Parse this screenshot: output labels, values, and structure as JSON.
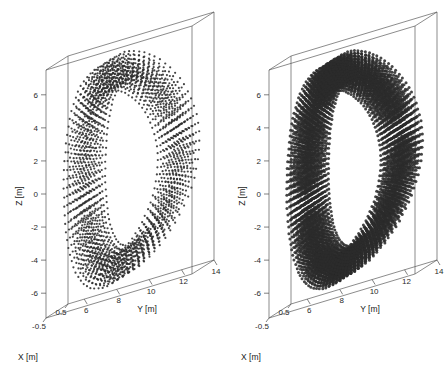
{
  "figure": {
    "background": "#ffffff",
    "line_color": "#5a5a5a",
    "marker_color": "#2b2b2b",
    "panel_count": 2
  },
  "chart_data": [
    {
      "type": "scatter",
      "title": "",
      "panel_label": "left",
      "xlabel": "X [m]",
      "ylabel": "Y [m]",
      "zlabel": "Z [m]",
      "xlim": [
        -0.5,
        0.5
      ],
      "ylim": [
        5,
        14
      ],
      "zlim": [
        -7.5,
        7.5
      ],
      "xticks": [
        -0.5,
        0.5
      ],
      "xtick_labels": [
        "-0.5",
        "0.5"
      ],
      "yticks": [
        6,
        8,
        10,
        12,
        14
      ],
      "ytick_labels": [
        "6",
        "8",
        "10",
        "12",
        "14"
      ],
      "zticks": [
        -6,
        -4,
        -2,
        0,
        2,
        4,
        6
      ],
      "ztick_labels": [
        "-6",
        "-4",
        "-2",
        "0",
        "2",
        "4",
        "6"
      ],
      "grid": false,
      "legend": false,
      "marker": "dot",
      "marker_size": 1.1,
      "point_density": "sparse",
      "shape_description": "D-shaped toroidal ring of points in the Y-Z plane, extruded slightly along X",
      "ring": {
        "center_y": 9.6,
        "center_z": 0.0,
        "outer_semi_y": 3.5,
        "outer_semi_z": 6.7,
        "inner_semi_y": 2.3,
        "inner_semi_z": 5.1,
        "triangularity": 0.32,
        "elongation": 1.9,
        "n_angular": 76,
        "n_radial": 7,
        "n_x_layers": 5
      }
    },
    {
      "type": "scatter",
      "title": "",
      "panel_label": "right",
      "xlabel": "X [m]",
      "ylabel": "Y [m]",
      "zlabel": "Z [m]",
      "xlim": [
        -0.5,
        0.5
      ],
      "ylim": [
        5,
        14
      ],
      "zlim": [
        -7.5,
        7.5
      ],
      "xticks": [
        -0.5,
        0.5
      ],
      "xtick_labels": [
        "-0.5",
        "0.5"
      ],
      "yticks": [
        6,
        8,
        10,
        12,
        14
      ],
      "ytick_labels": [
        "6",
        "8",
        "10",
        "12",
        "14"
      ],
      "zticks": [
        -6,
        -4,
        -2,
        0,
        2,
        4,
        6
      ],
      "ztick_labels": [
        "-6",
        "-4",
        "-2",
        "0",
        "2",
        "4",
        "6"
      ],
      "grid": false,
      "legend": false,
      "marker": "dot",
      "marker_size": 1.5,
      "point_density": "dense",
      "shape_description": "D-shaped toroidal ring of points in the Y-Z plane, denser sampling, extruded along X",
      "ring": {
        "center_y": 9.6,
        "center_z": 0.0,
        "outer_semi_y": 3.5,
        "outer_semi_z": 6.7,
        "inner_semi_y": 2.3,
        "inner_semi_z": 5.1,
        "triangularity": 0.32,
        "elongation": 1.9,
        "n_angular": 104,
        "n_radial": 10,
        "n_x_layers": 7
      }
    }
  ]
}
